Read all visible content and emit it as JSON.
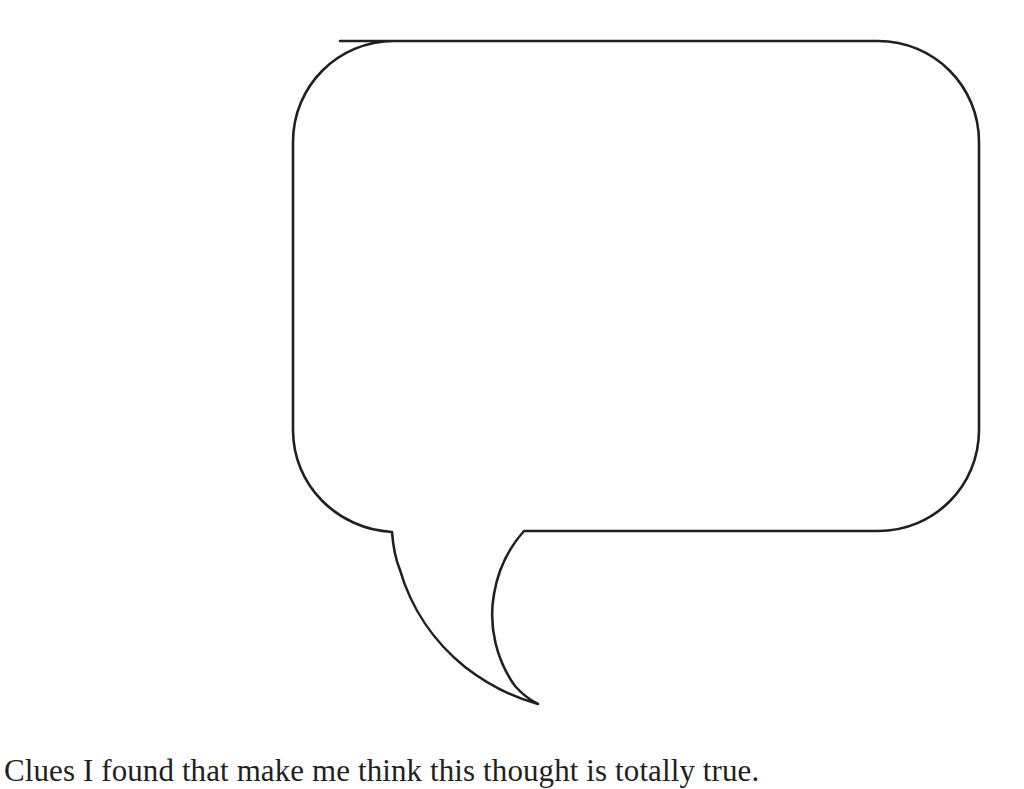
{
  "page": {
    "background_color": "#ffffff",
    "ink_color": "#231f20",
    "width": 1024,
    "height": 789
  },
  "speech_bubble": {
    "name": "empty-speech-bubble",
    "fill_color": "#ffffff",
    "stroke_color": "#231f20",
    "stroke_width": 2.6,
    "content": "",
    "geometry": {
      "body_left": 238,
      "body_right": 980,
      "body_top": 40,
      "body_bottom": 532,
      "corner_radius": 100,
      "tail_left_junction_x": 392,
      "tail_right_junction_x": 523,
      "tail_tip_x": 537,
      "tail_tip_y": 703,
      "tail_direction": "down-left"
    }
  },
  "caption": {
    "text": "Clues I found that make me think this thought is totally true.",
    "font_size_px": 31,
    "color": "#231f20"
  }
}
